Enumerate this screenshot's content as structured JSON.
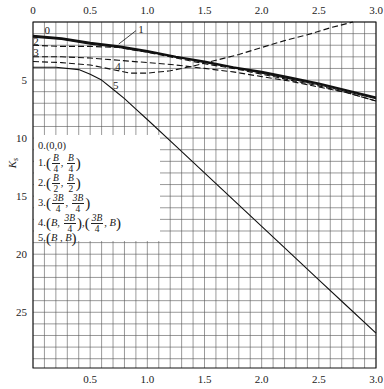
{
  "chart_data": {
    "type": "line",
    "title": "",
    "xlabel": "",
    "ylabel": "K_s",
    "xlim": [
      0,
      3.0
    ],
    "ylim": [
      0,
      29.8
    ],
    "y_inverted": true,
    "x_ticks_top": [
      "0",
      "0.5",
      "1.0",
      "1.5",
      "2.0",
      "2.5",
      "3.0"
    ],
    "x_ticks_bottom": [
      "0.5",
      "1.0",
      "1.5",
      "2.0",
      "2.5",
      "3.0"
    ],
    "y_ticks": [
      "5",
      "10",
      "15",
      "20",
      "25"
    ],
    "grid": true,
    "grid_step_x": 0.1,
    "grid_step_y": 1,
    "legend_position": "inside-left",
    "series": [
      {
        "name": "0",
        "label": "0.(0,0)",
        "style": "solid-thick",
        "x": [
          0,
          0.25,
          0.5,
          0.75,
          1.0,
          1.25,
          1.5,
          1.75,
          2.0,
          2.25,
          2.5,
          2.75,
          3.0
        ],
        "y": [
          1.2,
          1.4,
          1.8,
          2.1,
          2.5,
          3.0,
          3.4,
          3.9,
          4.3,
          4.8,
          5.3,
          5.9,
          6.5
        ]
      },
      {
        "name": "1",
        "label": "1.(B/4, B/4)",
        "style": "solid",
        "x": [
          0,
          0.25,
          0.5,
          0.75,
          1.0,
          1.25,
          1.5,
          1.75,
          2.0,
          2.25,
          2.5,
          2.75,
          3.0
        ],
        "y": [
          1.3,
          1.5,
          1.9,
          2.2,
          2.6,
          3.0,
          3.5,
          3.9,
          4.4,
          4.9,
          5.4,
          6.0,
          6.6
        ]
      },
      {
        "name": "2",
        "label": "2.(B/2, B/2)",
        "style": "dashed",
        "x": [
          0,
          0.25,
          0.5,
          0.75,
          1.0,
          1.25,
          1.5,
          1.75,
          2.0,
          2.25,
          2.5,
          2.75,
          3.0
        ],
        "y": [
          2.0,
          2.1,
          2.1,
          2.2,
          2.6,
          3.1,
          3.6,
          4.0,
          4.5,
          5.0,
          5.5,
          6.1,
          6.8
        ]
      },
      {
        "name": "3",
        "label": "3.(3B/4, 3B/4)",
        "style": "dashed",
        "x": [
          0,
          0.25,
          0.5,
          0.75,
          1.0,
          1.25,
          1.5,
          1.75,
          2.0,
          2.25,
          2.5,
          2.75,
          3.0
        ],
        "y": [
          3.0,
          3.0,
          3.1,
          3.3,
          3.5,
          3.7,
          4.0,
          4.3,
          4.7,
          5.1,
          5.6,
          6.1,
          6.8
        ]
      },
      {
        "name": "4",
        "label": "4.(B, 3B/4), (3B/4, B)",
        "style": "dashed",
        "x": [
          0,
          0.25,
          0.5,
          0.7,
          0.85,
          1.0,
          1.2,
          1.4,
          1.6,
          1.8,
          2.0,
          2.2,
          2.4,
          2.6,
          2.8
        ],
        "y": [
          3.4,
          3.5,
          3.7,
          4.1,
          4.4,
          4.4,
          4.2,
          3.8,
          3.3,
          2.8,
          2.2,
          1.6,
          1.1,
          0.5,
          0.0
        ]
      },
      {
        "name": "5",
        "label": "5.(B, B)",
        "style": "solid",
        "x": [
          0,
          0.2,
          0.4,
          0.5,
          0.6,
          0.7,
          0.8,
          0.9,
          1.0,
          1.25,
          1.5,
          1.75,
          2.0,
          2.25,
          2.5,
          2.75,
          3.0
        ],
        "y": [
          3.9,
          3.9,
          4.1,
          4.5,
          5.0,
          5.8,
          6.6,
          7.5,
          8.4,
          10.7,
          13.0,
          15.3,
          17.6,
          19.9,
          22.2,
          24.5,
          26.8
        ]
      }
    ],
    "annotations": [
      {
        "text": "0",
        "x": 0.1,
        "y": 0.7
      },
      {
        "text": "1",
        "x": 0.92,
        "y": 0.6
      },
      {
        "text": "2",
        "x": -0.05,
        "y": 1.6
      },
      {
        "text": "3",
        "x": -0.05,
        "y": 2.6
      },
      {
        "text": "4",
        "x": 0.72,
        "y": 3.8
      },
      {
        "text": "5",
        "x": 0.7,
        "y": 5.4
      }
    ]
  },
  "legend": {
    "title_item": "0.(0,0)",
    "items": [
      {
        "index": "1.",
        "a_num": "B",
        "a_den": "4",
        "b_num": "B",
        "b_den": "4"
      },
      {
        "index": "2.",
        "a_num": "B",
        "a_den": "2",
        "b_num": "B",
        "b_den": "2"
      },
      {
        "index": "3.",
        "a_num": "3B",
        "a_den": "4",
        "b_num": "3B",
        "b_den": "4"
      }
    ],
    "item4": {
      "index": "4.",
      "first_a": "B",
      "first_b_num": "3B",
      "first_b_den": "4",
      "second_a_num": "3B",
      "second_a_den": "4",
      "second_b": "B"
    },
    "item5": {
      "index": "5.",
      "text": "B , B"
    }
  }
}
